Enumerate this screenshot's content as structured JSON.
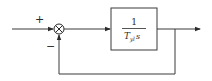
{
  "diagram": {
    "type": "block-diagram",
    "summing_junction": {
      "plus_sign": "+",
      "minus_sign": "−"
    },
    "block": {
      "numerator": "1",
      "denominator_var": "T",
      "denominator_sub": "yl",
      "denominator_s": "s"
    },
    "colors": {
      "line": "#3a3a3a",
      "background": "#ffffff"
    }
  }
}
